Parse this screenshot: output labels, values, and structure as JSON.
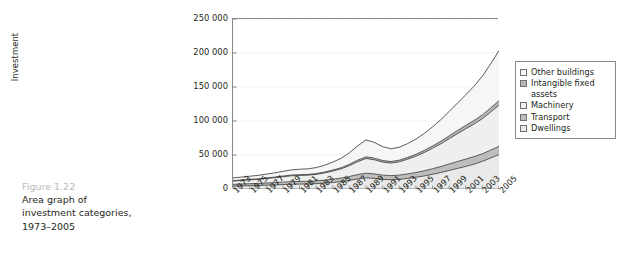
{
  "caption": {
    "figure_number": "Figure 1.22",
    "line1": "Area graph of",
    "line2": "investment categories,",
    "line3": "1973–2005"
  },
  "chart_data": {
    "type": "area",
    "title": "",
    "xlabel": "",
    "ylabel": "Investment",
    "ylim": [
      0,
      250000
    ],
    "ytick_labels": [
      "0",
      "50 000",
      "100 000",
      "150 000",
      "200 000",
      "250 000"
    ],
    "ytick_values": [
      0,
      50000,
      100000,
      150000,
      200000,
      250000
    ],
    "grid": true,
    "legend_position": "right",
    "stacked": true,
    "x": [
      1973,
      1974,
      1975,
      1976,
      1977,
      1978,
      1979,
      1980,
      1981,
      1982,
      1983,
      1984,
      1985,
      1986,
      1987,
      1988,
      1989,
      1990,
      1991,
      1992,
      1993,
      1994,
      1995,
      1996,
      1997,
      1998,
      1999,
      2000,
      2001,
      2002,
      2003,
      2004,
      2005
    ],
    "xtick_labels": [
      "1973",
      "1975",
      "1977",
      "1979",
      "1981",
      "1983",
      "1985",
      "1987",
      "1989",
      "1991",
      "1993",
      "1995",
      "1997",
      "1999",
      "2001",
      "2003",
      "2005"
    ],
    "series": [
      {
        "name": "Dwellings",
        "color": "#e9e9e9",
        "values": [
          4200,
          4600,
          4900,
          5200,
          5600,
          6000,
          6500,
          7000,
          7200,
          7400,
          7900,
          8600,
          9600,
          10800,
          12600,
          14800,
          16400,
          15600,
          14200,
          13600,
          14200,
          15600,
          17200,
          19200,
          21600,
          24200,
          27200,
          30200,
          33200,
          36600,
          40600,
          45600,
          50600
        ]
      },
      {
        "name": "Transport",
        "color": "#bdbdbd",
        "values": [
          2600,
          2800,
          2900,
          3000,
          3200,
          3400,
          3600,
          3800,
          3900,
          3900,
          4100,
          4400,
          4800,
          5200,
          5800,
          6400,
          6900,
          6600,
          6200,
          6000,
          6200,
          6600,
          7000,
          7600,
          8200,
          8800,
          9500,
          10200,
          10800,
          11000,
          11200,
          11600,
          12200
        ]
      },
      {
        "name": "Machinery",
        "color": "#efefef",
        "values": [
          4800,
          5200,
          5600,
          6000,
          6600,
          7200,
          7900,
          8600,
          8900,
          9000,
          9500,
          10600,
          12000,
          13600,
          16000,
          19000,
          21600,
          20800,
          19200,
          18600,
          19600,
          21600,
          24000,
          26800,
          30000,
          33400,
          37200,
          41000,
          44600,
          48000,
          51600,
          56000,
          60400
        ]
      },
      {
        "name": "Intangible fixed assets",
        "color": "#b5b5b5",
        "values": [
          600,
          650,
          700,
          750,
          820,
          900,
          980,
          1060,
          1100,
          1120,
          1180,
          1300,
          1450,
          1620,
          1880,
          2180,
          2450,
          2380,
          2250,
          2220,
          2350,
          2550,
          2800,
          3080,
          3400,
          3750,
          4150,
          4550,
          4900,
          5250,
          5600,
          6050,
          6500
        ]
      },
      {
        "name": "Other buildings",
        "color": "#f6f6f6",
        "values": [
          4000,
          4400,
          4700,
          5100,
          5600,
          6200,
          6900,
          7600,
          8000,
          8200,
          8800,
          10000,
          11800,
          13800,
          17000,
          21000,
          24800,
          23200,
          20400,
          18800,
          19000,
          20400,
          22400,
          25000,
          28200,
          31800,
          36000,
          40400,
          45000,
          50400,
          57000,
          64800,
          74000
        ]
      }
    ]
  },
  "legend": {
    "items": [
      {
        "label": "Other buildings",
        "swatch": "#f6f6f6"
      },
      {
        "label": "Intangible fixed assets",
        "swatch": "#b5b5b5"
      },
      {
        "label": "Machinery",
        "swatch": "#efefef"
      },
      {
        "label": "Transport",
        "swatch": "#bdbdbd"
      },
      {
        "label": "Dwellings",
        "swatch": "#e9e9e9"
      }
    ]
  },
  "axes": {
    "axis_color": "#8a8a8a",
    "grid_color": "#d8d8d8",
    "line_color": "#4a4a4a"
  }
}
